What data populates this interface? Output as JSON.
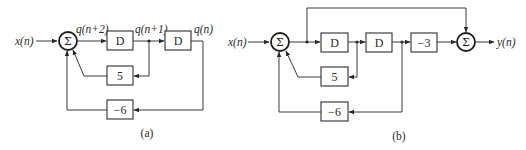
{
  "diagrams": {
    "a": {
      "caption": "(a)",
      "input_label": "x(n)",
      "sum_symbol": "Σ",
      "signal_labels": {
        "q_n2": "q(n+2)",
        "q_n1": "q(n+1)",
        "q_n": "q(n)"
      },
      "blocks": {
        "delay1": "D",
        "delay2": "D",
        "gain_5": "5",
        "gain_m6": "−6"
      }
    },
    "b": {
      "caption": "(b)",
      "input_label": "x(n)",
      "output_label": "y(n)",
      "sum1_symbol": "Σ",
      "sum2_symbol": "Σ",
      "blocks": {
        "delay1": "D",
        "delay2": "D",
        "gain_m3": "−3",
        "gain_5": "5",
        "gain_m6": "−6"
      }
    }
  },
  "colors": {
    "line": "#3a3a3a",
    "background": "#ffffff"
  }
}
